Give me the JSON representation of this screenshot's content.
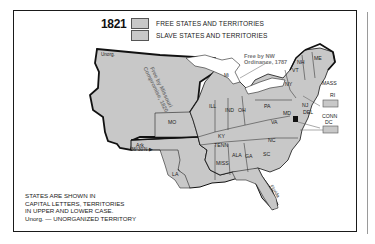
{
  "map": {
    "year": "1821",
    "legend": [
      {
        "label": "FREE STATES AND TERRITORIES",
        "color": "#c8c8c8"
      },
      {
        "label": "SLAVE STATES AND TERRITORIES",
        "color": "#c8c8c8"
      }
    ],
    "annotations": {
      "nw_ordinance_line1": "Free by NW",
      "nw_ordinance_line2": "Ordinance, 1787",
      "missouri_line1": "Free by Missouri",
      "missouri_line2": "Compromise, 1820",
      "latitude": "36°30'N ▶",
      "unorg": "Unorg."
    },
    "states": {
      "me": "ME",
      "nh": "NH",
      "vt": "VT",
      "ny": "NY",
      "mass": "MASS",
      "ri": "RI",
      "conn": "CONN",
      "nj": "NJ",
      "del": "DEL",
      "dc": "DC",
      "pa": "PA",
      "md": "MD",
      "va": "VA",
      "nc": "NC",
      "sc": "SC",
      "ga": "GA",
      "ala": "ALA",
      "miss": "MISS",
      "la": "LA",
      "tenn": "TENN",
      "ky": "KY",
      "oh": "OH",
      "ind": "IND",
      "ill": "ILL",
      "mo": "MO",
      "ark": "Ark",
      "mi": "Mi",
      "florida": "Florida"
    },
    "note": {
      "line1": "STATES ARE SHOWN IN",
      "line2": "CAPITAL LETTERS, TERRITORIES",
      "line3": "IN UPPER AND LOWER CASE.",
      "line4": "Unorg. — UNORGANIZED TERRITORY"
    },
    "colors": {
      "land": "#c8c8c8",
      "border": "#111111",
      "annotation": "#7a7a7a"
    }
  }
}
